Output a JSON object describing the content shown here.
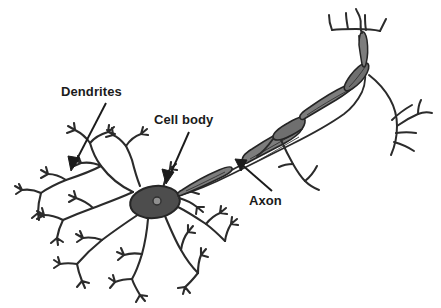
{
  "figure": {
    "background_color": "#ffffff",
    "ink_color": "#2b2b2b",
    "soma_fill": "#4d4d4d",
    "nucleus_fill": "#8a8a8a",
    "myelin_fill": "#7d7d7d",
    "width": 441,
    "height": 308
  },
  "labels": {
    "dendrites": "Dendrites",
    "cell_body": "Cell body",
    "axon": "Axon"
  },
  "annotations": [
    {
      "name": "dendrites-arrow",
      "label": "Dendrites",
      "from": [
        106,
        103
      ],
      "to": [
        71,
        171
      ]
    },
    {
      "name": "cell-body-arrow",
      "label": "Cell body",
      "from": [
        189,
        132
      ],
      "to": [
        166,
        184
      ]
    },
    {
      "name": "axon-arrow",
      "label": "Axon",
      "from": [
        272,
        191
      ],
      "to": [
        235,
        159
      ]
    }
  ],
  "parts": {
    "soma": {
      "name": "cell body (soma)",
      "center": [
        155,
        202
      ],
      "radius_x": 25,
      "radius_y": 16
    },
    "nucleus": {
      "name": "nucleus",
      "center": [
        157,
        201
      ],
      "radius": 4
    },
    "axon_hillock": [
      181,
      193
    ],
    "myelin_segments": 4,
    "dendrite_clusters": 7,
    "axon_terminals": 3
  }
}
